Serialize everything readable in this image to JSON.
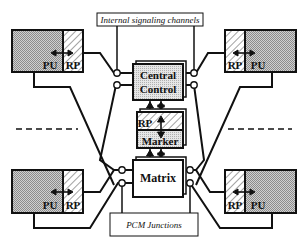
{
  "diagram": {
    "title_box": {
      "label": "Internal signaling channels"
    },
    "bottom_box": {
      "label": "PCM Junctions"
    },
    "units": [
      {
        "id": "top-left",
        "pu": "PU",
        "rp": "RP"
      },
      {
        "id": "top-right",
        "pu": "PU",
        "rp": "RP"
      },
      {
        "id": "bottom-left",
        "pu": "PU",
        "rp": "RP"
      },
      {
        "id": "bottom-right",
        "pu": "PU",
        "rp": "RP"
      }
    ],
    "central_control": {
      "line1": "Central",
      "line2": "Control"
    },
    "marker": {
      "rp": "RP",
      "label": "Marker"
    },
    "matrix": {
      "label": "Matrix"
    },
    "colors": {
      "line": "#111111",
      "shade": "#b8b8b8",
      "hatch": "#8a8a8a",
      "box_bg": "#ffffff"
    }
  }
}
